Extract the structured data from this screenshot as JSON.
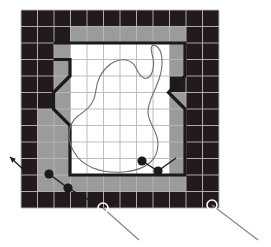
{
  "figure": {
    "type": "grid-map-diagram"
  },
  "colors": {
    "occupied": "#231a1c",
    "inflated": "#9b9b9b",
    "free": "#ffffff",
    "grid_line": "#b7b7b7",
    "boundary": "#1a1a1a",
    "contour": "#6f6f6f",
    "waypoint_fill": "#1a1a1a",
    "leader_line": "#8a8a8a",
    "background": "#ffffff"
  },
  "grid": {
    "origin_x": 21,
    "origin_y": 10,
    "cell_size": 16.5,
    "cols": 12,
    "rows": 12,
    "legend": {
      "0": "free",
      "1": "occupied",
      "2": "inflated"
    },
    "cells": [
      [
        1,
        1,
        1,
        1,
        1,
        1,
        1,
        1,
        1,
        1,
        1,
        1
      ],
      [
        1,
        1,
        1,
        2,
        2,
        2,
        2,
        2,
        2,
        2,
        1,
        1
      ],
      [
        1,
        1,
        2,
        0,
        0,
        0,
        0,
        0,
        0,
        2,
        1,
        1
      ],
      [
        1,
        1,
        2,
        0,
        0,
        0,
        0,
        0,
        0,
        2,
        1,
        1
      ],
      [
        1,
        1,
        2,
        0,
        0,
        0,
        0,
        0,
        0,
        1,
        1,
        1
      ],
      [
        1,
        1,
        2,
        0,
        0,
        0,
        0,
        0,
        0,
        2,
        1,
        1
      ],
      [
        1,
        2,
        2,
        0,
        0,
        0,
        0,
        0,
        0,
        2,
        1,
        1
      ],
      [
        1,
        2,
        2,
        0,
        0,
        0,
        0,
        0,
        0,
        2,
        1,
        1
      ],
      [
        1,
        2,
        2,
        0,
        0,
        0,
        0,
        0,
        0,
        2,
        1,
        1
      ],
      [
        1,
        2,
        2,
        0,
        0,
        0,
        0,
        0,
        0,
        2,
        1,
        1
      ],
      [
        1,
        2,
        2,
        2,
        2,
        2,
        2,
        2,
        2,
        2,
        1,
        1
      ],
      [
        1,
        1,
        1,
        1,
        1,
        1,
        1,
        1,
        1,
        1,
        1,
        1
      ]
    ]
  },
  "boundary": {
    "label": "free-space-boundary",
    "stroke_width": 3.2,
    "points": "53.5,43 185,43 185,76 168.5,92.5 185,109 185,175 70,175 70,125.5 53.5,109 53.5,92.5 70,76 70,59.5 53.5,59.5"
  },
  "contour": {
    "label": "closed-contour-path",
    "stroke_width": 1.1,
    "path": "M 96 90 C 98 72, 112 58, 126 60 C 138 62, 136 76, 144 78 C 152 80, 156 66, 152 54 C 150 46, 152 44, 156 46 C 162 49, 164 62, 160 76 C 155 93, 148 100, 148 112 C 148 124, 158 130, 158 144 C 158 160, 146 170, 124 172 C 100 174, 82 166, 74 152 C 66 138, 68 124, 78 116 C 86 110, 94 106, 96 90 Z"
  },
  "waypoints": {
    "label": "path-waypoints",
    "radius": 4.6,
    "items": [
      {
        "name": "waypoint-1",
        "x": 49,
        "y": 174
      },
      {
        "name": "waypoint-2",
        "x": 68,
        "y": 188
      },
      {
        "name": "waypoint-3",
        "x": 142,
        "y": 161
      },
      {
        "name": "waypoint-4",
        "x": 158,
        "y": 171
      }
    ],
    "segments": [
      {
        "x1": 49,
        "y1": 174,
        "x2": 68,
        "y2": 188
      },
      {
        "x1": 68,
        "y1": 188,
        "x2": 103,
        "y2": 208
      },
      {
        "x1": 142,
        "y1": 161,
        "x2": 158,
        "y2": 171
      },
      {
        "x1": 158,
        "y1": 171,
        "x2": 176,
        "y2": 158
      }
    ]
  },
  "callouts": {
    "label": "annotation-callouts",
    "radius": 5.0,
    "stroke_width": 1.6,
    "items": [
      {
        "name": "callout-bottom-center",
        "cx": 103,
        "cy": 208,
        "lx": 139,
        "ly": 240
      },
      {
        "name": "callout-bottom-right",
        "cx": 212,
        "cy": 205,
        "lx": 258,
        "ly": 240
      }
    ]
  },
  "arrow": {
    "label": "incoming-direction-arrow",
    "tail_x": 26,
    "tail_y": 172,
    "head_x": 10,
    "head_y": 157,
    "stroke_width": 1.2
  }
}
